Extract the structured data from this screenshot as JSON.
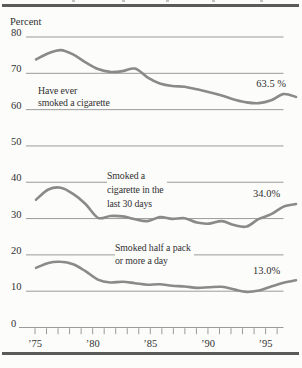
{
  "chart_data": {
    "type": "line",
    "title": "",
    "ylabel": "Percent",
    "ylim": [
      0,
      80
    ],
    "yticks": [
      80,
      70,
      60,
      50,
      40,
      30,
      20,
      10,
      0
    ],
    "grid": true,
    "years": [
      1975,
      1976,
      1977,
      1978,
      1979,
      1980,
      1981,
      1982,
      1983,
      1984,
      1985,
      1986,
      1987,
      1988,
      1989,
      1990,
      1991,
      1992,
      1993,
      1994,
      1995,
      1996
    ],
    "xtick_labels": [
      "’75",
      "’80",
      "’85",
      "’90",
      "’95"
    ],
    "xtick_label_years": [
      1975,
      1980,
      1985,
      1990,
      1995
    ],
    "series": [
      {
        "name": "Have ever smoked a cigarette",
        "annotation_lines": [
          "Have ever",
          "smoked a cigarette"
        ],
        "end_label": "63.5 %",
        "values": [
          73.8,
          75.5,
          76.4,
          75.2,
          73.0,
          71.2,
          70.4,
          70.6,
          71.3,
          68.9,
          67.2,
          66.5,
          66.3,
          65.6,
          64.8,
          63.9,
          62.8,
          62.0,
          61.8,
          62.6,
          64.3,
          63.5
        ]
      },
      {
        "name": "Smoked a cigarette in the last 30 days",
        "annotation_lines": [
          "Smoked a",
          "cigarette in the",
          "last 30 days"
        ],
        "end_label": "34.0%",
        "values": [
          35.2,
          38.0,
          38.5,
          36.8,
          34.0,
          30.2,
          30.7,
          30.6,
          29.8,
          29.3,
          30.4,
          29.9,
          30.1,
          28.9,
          28.6,
          29.3,
          28.2,
          27.8,
          29.9,
          31.2,
          33.3,
          34.0
        ]
      },
      {
        "name": "Smoked half a pack or more a day",
        "annotation_lines": [
          "Smoked half a pack",
          "or more a day"
        ],
        "end_label": "13.0%",
        "values": [
          16.4,
          17.8,
          18.1,
          17.4,
          15.5,
          13.2,
          12.4,
          12.6,
          12.2,
          11.8,
          11.9,
          11.5,
          11.3,
          10.9,
          11.1,
          11.2,
          10.5,
          9.8,
          10.2,
          11.3,
          12.3,
          13.0
        ]
      }
    ],
    "colors": {
      "line": "#8a8a8a",
      "grid": "#9b9b9b",
      "text": "#303030",
      "rule": "#5a5a5a"
    }
  }
}
